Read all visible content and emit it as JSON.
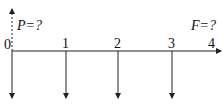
{
  "diagram": {
    "type": "cash-flow-diagram",
    "timeline": {
      "periods": [
        "0",
        "1",
        "2",
        "3",
        "4"
      ]
    },
    "labels": {
      "present_value": "P=?",
      "future_value": "F=?"
    },
    "cash_flows": [
      {
        "period": "0",
        "direction": "up",
        "style": "dashed",
        "label": "P=?"
      },
      {
        "period": "0",
        "direction": "down",
        "style": "solid"
      },
      {
        "period": "1",
        "direction": "down",
        "style": "solid"
      },
      {
        "period": "2",
        "direction": "down",
        "style": "solid"
      },
      {
        "period": "3",
        "direction": "down",
        "style": "solid"
      },
      {
        "period": "4",
        "direction": "none",
        "label": "F=?"
      }
    ]
  }
}
